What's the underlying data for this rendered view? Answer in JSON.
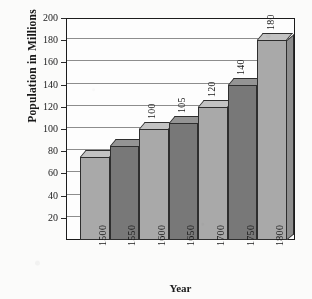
{
  "chart_data": {
    "type": "bar",
    "title": "",
    "xlabel": "Year",
    "ylabel": "Population in Millions",
    "categories": [
      "1500",
      "1550",
      "1600",
      "1650",
      "1700",
      "1750",
      "1800"
    ],
    "values": [
      75,
      85,
      100,
      105,
      120,
      140,
      180
    ],
    "data_labels": [
      "",
      "",
      "100",
      "105",
      "120",
      "140",
      "180"
    ],
    "ylim": [
      0,
      200
    ],
    "ytick_values": [
      20,
      40,
      60,
      80,
      100,
      120,
      140,
      160,
      180,
      200
    ],
    "ytick_labels": [
      "20",
      "40",
      "60",
      "80",
      "100",
      "120",
      "140",
      "160",
      "180",
      "200"
    ],
    "grid": true,
    "legend": "none",
    "style": "3d-bars-alternating-gray",
    "bar_colors": [
      "#a9a9a9",
      "#787878",
      "#a9a9a9",
      "#787878",
      "#a9a9a9",
      "#787878",
      "#a9a9a9"
    ],
    "colors": {
      "light_bar": "#a9a9a9",
      "dark_bar": "#787878",
      "frame": "#1c1c1c",
      "gridline": "#8d8d8d",
      "background": "#fbfbf9",
      "text": "#1a1a1a"
    }
  }
}
